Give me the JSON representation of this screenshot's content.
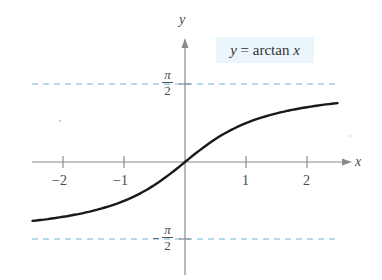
{
  "chart_data": {
    "type": "line",
    "title": "",
    "function_label": "y = arctan x",
    "function_label_parts": {
      "lhs": "y",
      "eq": " = arctan ",
      "var": "x"
    },
    "xlabel": "x",
    "ylabel": "y",
    "xlim": [
      -2.5,
      2.7
    ],
    "ylim": [
      -1.9,
      2.4
    ],
    "x_ticks": [
      -2,
      -1,
      1,
      2
    ],
    "x_tick_labels": [
      "−2",
      "−1",
      "1",
      "2"
    ],
    "y_reference_lines": [
      {
        "value": 1.5708,
        "label": "π/2",
        "style": "dashed",
        "color": "#6fb3dc"
      },
      {
        "value": -1.5708,
        "label": "−π/2",
        "style": "dashed",
        "color": "#6fb3dc"
      }
    ],
    "series": [
      {
        "name": "y = arctan x",
        "color": "#1a1a1a",
        "x": [
          -2.5,
          -2.0,
          -1.5,
          -1.0,
          -0.5,
          0,
          0.5,
          1.0,
          1.5,
          2.0,
          2.5
        ],
        "values": [
          -1.19,
          -1.107,
          -0.983,
          -0.785,
          -0.464,
          0,
          0.464,
          0.785,
          0.983,
          1.107,
          1.19
        ]
      }
    ],
    "grid": false,
    "legend": "none",
    "colors": {
      "axis": "#7a7a7a",
      "curve": "#1a1a1a",
      "asymptote": "#6fb3dc",
      "label_bg": "#eaf6fb"
    }
  },
  "labels": {
    "y_axis": "y",
    "x_axis": "x",
    "pi": "π",
    "two": "2",
    "minus": "−",
    "tick_m2": "−2",
    "tick_m1": "−1",
    "tick_1": "1",
    "tick_2": "2"
  }
}
